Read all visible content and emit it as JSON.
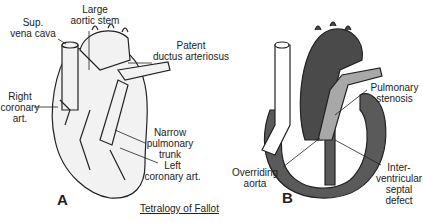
{
  "title": "Tetralogy of Fallot",
  "panels": {
    "a": {
      "letter": "A",
      "labels": {
        "sup_vena_cava": "Sup.\nvena cava",
        "large_aortic_stem": "Large\naortic stem",
        "patent_ductus": "Patent\nductus arteriosus",
        "right_coronary": "Right\ncoronary\nart.",
        "narrow_pulmonary": "Narrow\npulmonary\ntrunk",
        "left_coronary": "Left\ncoronary art."
      }
    },
    "b": {
      "letter": "B",
      "labels": {
        "pulmonary_stenosis": "Pulmonary\nstenosis",
        "overriding_aorta": "Overriding\naorta",
        "vsd": "Inter-\nventricular\nseptal\ndefect"
      }
    }
  },
  "colors": {
    "outline": "#222222",
    "aorta_dark": "#4a4a4a",
    "pulmonary_gray": "#a8a8a8",
    "wall": "#5a5a5a",
    "heart_fill": "#f2f2f2"
  }
}
